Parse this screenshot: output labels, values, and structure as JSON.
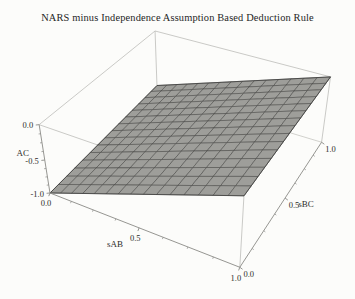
{
  "chart_data": {
    "type": "surface",
    "title": "NARS minus Independence Assumption Based Deduction Rule",
    "xlabel": "sAB",
    "ylabel": "sBC",
    "zlabel": "AC",
    "x_range": [
      0,
      1
    ],
    "y_range": [
      0,
      1
    ],
    "z_range": [
      -1,
      0
    ],
    "x_ticks": {
      "values": [
        0,
        0.5,
        1
      ],
      "labels": [
        "0.0",
        "0.5",
        "1.0"
      ],
      "minor_step": 0.125
    },
    "y_ticks": {
      "values": [
        0,
        0.5,
        1
      ],
      "labels": [
        "0.0",
        "0.5",
        "1.0"
      ],
      "minor_step": 0.125
    },
    "z_ticks": {
      "values": [
        0,
        -0.5,
        -1
      ],
      "labels": [
        "0.0",
        "-0.5",
        "-1.0"
      ],
      "minor_step": 0.125
    },
    "mesh_divisions": 15,
    "grid": "mesh-on-surface",
    "legend_position": "none",
    "surface": {
      "description": "difference AC = NARS deduction minus independence-assumption deduction; nearly planar sheet, bilinear through corner values",
      "corner_values": {
        "f_at_00": -1.0,
        "f_at_10": 0.0,
        "f_at_01": -0.875,
        "f_at_11": 0.0
      },
      "sample_grid": {
        "sAB": [
          0,
          0.25,
          0.5,
          0.75,
          1
        ],
        "sBC": [
          0,
          0.25,
          0.5,
          0.75,
          1
        ],
        "AC_rows_by_sAB": [
          [
            -1.0,
            -0.969,
            -0.938,
            -0.906,
            -0.875
          ],
          [
            -0.75,
            -0.727,
            -0.703,
            -0.68,
            -0.656
          ],
          [
            -0.5,
            -0.484,
            -0.469,
            -0.453,
            -0.438
          ],
          [
            -0.25,
            -0.242,
            -0.234,
            -0.227,
            -0.219
          ],
          [
            0.0,
            0.0,
            0.0,
            0.0,
            0.0
          ]
        ]
      }
    },
    "colors": {
      "surface_fill": "#9e9e9a",
      "mesh_line": "#3f3f3d",
      "axis_line": "#8a8a86",
      "box_line": "#bdbdb9",
      "hidden_line": "#c6c6c2",
      "text": "#2d2d2b",
      "background": "#fcfcfa"
    }
  }
}
